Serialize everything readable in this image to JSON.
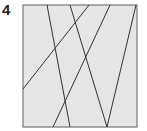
{
  "puzzle": {
    "number": "4",
    "square": {
      "x": 23,
      "y": 5,
      "width": 114,
      "height": 122,
      "fill": "#e6e6e6",
      "stroke": "#777777"
    },
    "line_color": "#333333",
    "lines": [
      {
        "x1": 47,
        "y1": 5,
        "x2": 70,
        "y2": 127
      },
      {
        "x1": 70,
        "y1": 5,
        "x2": 107,
        "y2": 127
      },
      {
        "x1": 89,
        "y1": 5,
        "x2": 23,
        "y2": 89
      },
      {
        "x1": 110,
        "y1": 5,
        "x2": 53,
        "y2": 127
      },
      {
        "x1": 136,
        "y1": 5,
        "x2": 107,
        "y2": 127
      }
    ]
  }
}
